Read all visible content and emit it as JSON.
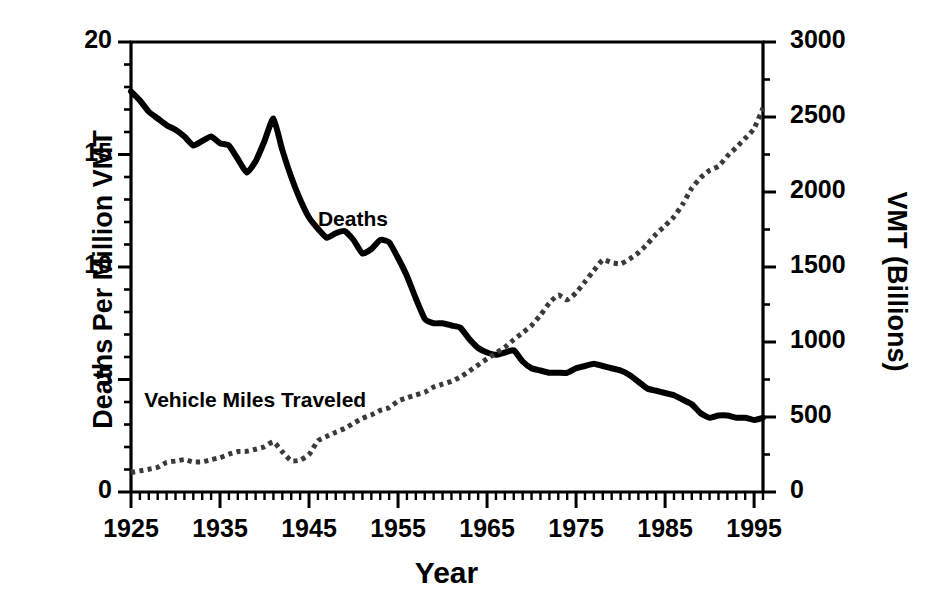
{
  "chart_data": {
    "type": "line",
    "title": "",
    "xlabel": "Year",
    "ylabel": "Deaths Per Million VMT",
    "ylabel_right": "VMT (Billions)",
    "xlim": [
      1925,
      1996
    ],
    "ylim": [
      0,
      20
    ],
    "ylim_right": [
      0,
      3000
    ],
    "grid": false,
    "legend_position": "inline-annotations",
    "xticks": [
      "1925",
      "1935",
      "1945",
      "1955",
      "1965",
      "1975",
      "1985",
      "1995"
    ],
    "xtick_values": [
      1925,
      1935,
      1945,
      1955,
      1965,
      1975,
      1985,
      1995
    ],
    "xminor_step": 1,
    "yticks_left": [
      "0",
      "5",
      "10",
      "15",
      "20"
    ],
    "ytick_values_left": [
      0,
      5,
      10,
      15,
      20
    ],
    "yminor_step_left": 1,
    "yticks_right": [
      "0",
      "500",
      "1000",
      "1500",
      "2000",
      "2500",
      "3000"
    ],
    "ytick_values_right": [
      0,
      500,
      1000,
      1500,
      2000,
      2500,
      3000
    ],
    "yminor_step_right": 250,
    "annotations": [
      {
        "text": "Deaths",
        "x": 1946,
        "y": 12.1
      },
      {
        "text": "Vehicle Miles Traveled",
        "x": 1926.5,
        "y": 4.05
      }
    ],
    "series": [
      {
        "name": "Deaths",
        "axis": "left",
        "style": "solid",
        "color": "#000000",
        "linewidth": 6,
        "x": [
          1925,
          1926,
          1927,
          1928,
          1929,
          1930,
          1931,
          1932,
          1933,
          1934,
          1935,
          1936,
          1937,
          1938,
          1939,
          1940,
          1941,
          1942,
          1943,
          1944,
          1945,
          1946,
          1947,
          1948,
          1949,
          1950,
          1951,
          1952,
          1953,
          1954,
          1955,
          1956,
          1957,
          1958,
          1959,
          1960,
          1961,
          1962,
          1963,
          1964,
          1965,
          1966,
          1967,
          1968,
          1969,
          1970,
          1971,
          1972,
          1973,
          1974,
          1975,
          1976,
          1977,
          1978,
          1979,
          1980,
          1981,
          1982,
          1983,
          1984,
          1985,
          1986,
          1987,
          1988,
          1989,
          1990,
          1991,
          1992,
          1993,
          1994,
          1995,
          1996
        ],
        "values": [
          17.8,
          17.4,
          16.9,
          16.6,
          16.3,
          16.1,
          15.8,
          15.4,
          15.6,
          15.8,
          15.5,
          15.4,
          14.8,
          14.2,
          14.7,
          15.6,
          16.6,
          15.2,
          14.0,
          13.0,
          12.2,
          11.7,
          11.3,
          11.5,
          11.6,
          11.2,
          10.6,
          10.8,
          11.2,
          11.1,
          10.4,
          9.6,
          8.6,
          7.7,
          7.5,
          7.5,
          7.4,
          7.3,
          6.8,
          6.4,
          6.2,
          6.1,
          6.2,
          6.3,
          5.8,
          5.5,
          5.4,
          5.3,
          5.3,
          5.3,
          5.5,
          5.6,
          5.7,
          5.6,
          5.5,
          5.4,
          5.2,
          4.9,
          4.6,
          4.5,
          4.4,
          4.3,
          4.1,
          3.9,
          3.5,
          3.3,
          3.4,
          3.4,
          3.3,
          3.3,
          3.2,
          3.3
        ]
      },
      {
        "name": "Deaths (continued)",
        "axis": "left",
        "style": "solid",
        "color": "#000000",
        "linewidth": 6,
        "x": [
          1970,
          1972,
          1974,
          1976,
          1978,
          1980,
          1982,
          1984,
          1986,
          1988,
          1990,
          1992,
          1994,
          1996
        ],
        "values": [
          4.9,
          4.5,
          3.6,
          3.3,
          3.4,
          3.4,
          2.8,
          2.6,
          2.6,
          2.3,
          2.1,
          1.8,
          1.8,
          1.7
        ]
      },
      {
        "name": "Vehicle Miles Traveled",
        "axis": "right",
        "style": "dotted",
        "color": "#3a3a3a",
        "linewidth": 5,
        "x": [
          1925,
          1926,
          1927,
          1928,
          1929,
          1930,
          1931,
          1932,
          1933,
          1934,
          1935,
          1936,
          1937,
          1938,
          1939,
          1940,
          1941,
          1942,
          1943,
          1944,
          1945,
          1946,
          1947,
          1948,
          1949,
          1950,
          1951,
          1952,
          1953,
          1954,
          1955,
          1956,
          1957,
          1958,
          1959,
          1960,
          1961,
          1962,
          1963,
          1964,
          1965,
          1966,
          1967,
          1968,
          1969,
          1970,
          1971,
          1972,
          1973,
          1974,
          1975,
          1976,
          1977,
          1978,
          1979,
          1980,
          1981,
          1982,
          1983,
          1984,
          1985,
          1986,
          1987,
          1988,
          1989,
          1990,
          1991,
          1992,
          1993,
          1994,
          1995,
          1996
        ],
        "values": [
          130,
          141,
          152,
          165,
          198,
          206,
          216,
          200,
          201,
          216,
          229,
          252,
          270,
          271,
          285,
          302,
          334,
          268,
          208,
          213,
          250,
          341,
          371,
          398,
          424,
          458,
          491,
          514,
          544,
          562,
          606,
          628,
          647,
          665,
          700,
          719,
          738,
          767,
          806,
          847,
          888,
          926,
          965,
          1016,
          1062,
          1110,
          1179,
          1260,
          1313,
          1281,
          1328,
          1402,
          1477,
          1548,
          1529,
          1521,
          1553,
          1595,
          1653,
          1720,
          1775,
          1835,
          1921,
          2026,
          2096,
          2144,
          2172,
          2240,
          2297,
          2358,
          2423,
          2560
        ]
      }
    ]
  },
  "axis_labels": {
    "left_title": "Deaths Per Million VMT",
    "right_title": "VMT (Billions)",
    "bottom_title": "Year"
  },
  "annotations": {
    "deaths": "Deaths",
    "vmt": "Vehicle Miles Traveled"
  },
  "colors": {
    "line": "#000000",
    "dotted": "#3a3a3a",
    "axis": "#000000",
    "background": "#ffffff"
  }
}
